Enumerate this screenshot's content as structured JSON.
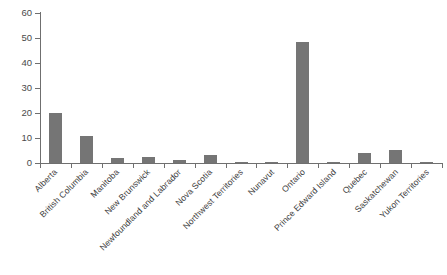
{
  "chart_data": {
    "type": "bar",
    "title": "",
    "subtitle": "",
    "xlabel": "",
    "ylabel": "",
    "ylim": [
      0,
      60
    ],
    "yticks": [
      0,
      10,
      20,
      30,
      40,
      50,
      60
    ],
    "grid": false,
    "legend": null,
    "bar_color": "#757575",
    "axis_color": "#6f6f6f",
    "text_color": "#3d3d3d",
    "categories": [
      "Alberta",
      "British Columbia",
      "Manitoba",
      "New Brunswick",
      "Newfoundland and Labrador",
      "Nova Scotia",
      "Northwest Territories",
      "Nunavut",
      "Ontario",
      "Prince Edward Island",
      "Quebec",
      "Saskatchewan",
      "Yukon Territories"
    ],
    "values": [
      20.2,
      10.8,
      2.0,
      2.4,
      1.2,
      3.3,
      0.4,
      0.3,
      48.6,
      0.4,
      4.2,
      5.3,
      0.3
    ]
  }
}
